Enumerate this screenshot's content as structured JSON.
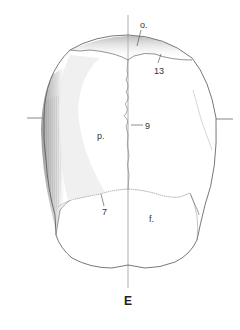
{
  "figure": {
    "panel_label": "E",
    "labels": [
      {
        "id": "o",
        "text": "o."
      },
      {
        "id": "13",
        "text": "13"
      },
      {
        "id": "9",
        "text": "9"
      },
      {
        "id": "p",
        "text": "p."
      },
      {
        "id": "7",
        "text": "7"
      },
      {
        "id": "f",
        "text": "f."
      }
    ],
    "colors": {
      "background": "#ffffff",
      "outline": "#555555",
      "shading": "#9a9a9a",
      "text": "#333333"
    }
  }
}
